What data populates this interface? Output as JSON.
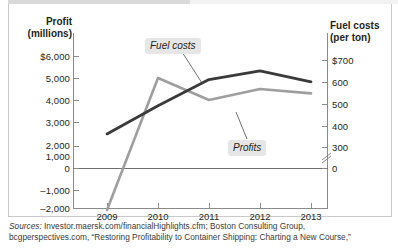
{
  "axes": {
    "left_title": "Profit\n(millions)",
    "left_title_l1": "Profit",
    "left_title_l2": "(millions)",
    "right_title_l1": "Fuel costs",
    "right_title_l2": "(per ton)",
    "left_ticks": [
      "$6,000",
      "5,000",
      "4,000",
      "3,000",
      "2,000",
      "1,000",
      "0",
      "–1,000",
      "–2,000"
    ],
    "right_ticks": [
      "$700",
      "600",
      "500",
      "400",
      "300",
      "0"
    ],
    "x_ticks": [
      "2009",
      "2010",
      "2011",
      "2012",
      "2013"
    ]
  },
  "callouts": {
    "fuel": "Fuel costs",
    "profits": "Profits"
  },
  "source": {
    "lead": "Sources:",
    "line1": " Investor.maersk.com/financialHighlights.cfm; Boston Consulting Group,",
    "line2": "bcgperspectives.com, “Restoring Profitability to Container Shipping: Charting a New Course,”"
  },
  "colors": {
    "profits_line": "#9e9e9e",
    "fuel_line": "#3a3a3a",
    "axis": "#8a8a8a",
    "callout_bg": "#e6e6e6",
    "text": "#231f20"
  },
  "chart_data": {
    "type": "line",
    "title": "",
    "xlabel": "",
    "categories": [
      "2009",
      "2010",
      "2011",
      "2012",
      "2013"
    ],
    "grid": false,
    "legend": "inline-callouts",
    "series": [
      {
        "name": "Profits",
        "axis": "left",
        "unit": "millions of dollars",
        "color": "#9e9e9e",
        "values": [
          -1000,
          5000,
          4000,
          4500,
          4300
        ]
      },
      {
        "name": "Fuel costs",
        "axis": "right",
        "unit": "dollars per ton",
        "color": "#3a3a3a",
        "values": [
          360,
          490,
          610,
          650,
          600
        ]
      }
    ],
    "ylabel": "Profit (millions)",
    "ylim": [
      -2000,
      6000
    ],
    "y2label": "Fuel costs (per ton)",
    "y2lim": [
      300,
      700
    ],
    "y2_axis_break": true
  }
}
